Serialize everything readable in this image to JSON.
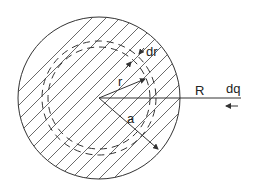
{
  "diagram": {
    "labels": {
      "dr": "dr",
      "r": "r",
      "a": "a",
      "R": "R",
      "dq": "dq"
    },
    "stroke_color": "#333333",
    "background": "#ffffff"
  }
}
